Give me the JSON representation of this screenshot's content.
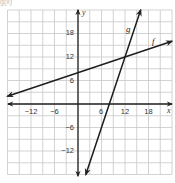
{
  "header_fragment": "g(x)",
  "chart_data": {
    "type": "line",
    "title": "",
    "xlabel": "x",
    "ylabel": "y",
    "xlim": [
      -18,
      24
    ],
    "ylim": [
      -18,
      24
    ],
    "grid": true,
    "grid_step": 3,
    "x_ticks": [
      -12,
      -6,
      6,
      12,
      18
    ],
    "y_ticks": [
      18,
      12,
      6,
      -6,
      -12
    ],
    "series": [
      {
        "name": "f",
        "equation": "f(x) = x/3 + 8",
        "slope": 0.3333,
        "intercept": 8,
        "points": [
          [
            -18,
            2
          ],
          [
            0,
            8
          ],
          [
            12,
            12
          ],
          [
            24,
            16
          ]
        ]
      },
      {
        "name": "g",
        "equation": "g(x) = 3x - 24",
        "slope": 3,
        "intercept": -24,
        "points": [
          [
            2,
            -18
          ],
          [
            8,
            0
          ],
          [
            12,
            12
          ],
          [
            16,
            24
          ]
        ]
      }
    ],
    "annotations": [
      {
        "text": "f",
        "near": [
          21,
          17
        ]
      },
      {
        "text": "g",
        "near": [
          13,
          18
        ]
      }
    ],
    "intersection": [
      12,
      12
    ]
  },
  "labels": {
    "x_axis": "x",
    "y_axis": "y",
    "f": "f",
    "g": "g",
    "xt": [
      "−12",
      "−6",
      "6",
      "12",
      "18"
    ],
    "yt": [
      "18",
      "12",
      "6",
      "−6",
      "−12"
    ]
  },
  "colors": {
    "grid": "#c8c8c8",
    "axis": "#222222",
    "line": "#1e1e1e"
  }
}
